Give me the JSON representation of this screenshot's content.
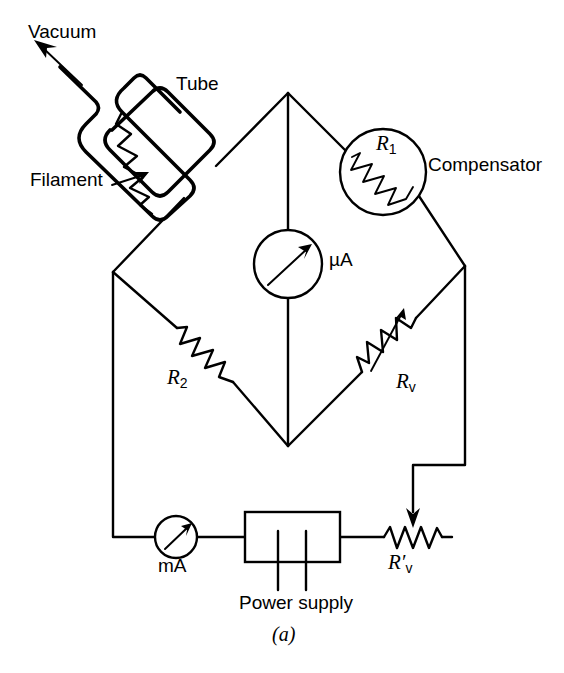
{
  "figure": {
    "caption": "(a)",
    "kind": "circuit-diagram",
    "ink_color": "#000000",
    "background_color": "#ffffff"
  },
  "labels": {
    "vacuum": "Vacuum",
    "tube": "Tube",
    "filament": "Filament",
    "compensator": "Compensator",
    "microammeter": "µA",
    "milliammeter": "mA",
    "power_supply": "Power supply"
  },
  "components": [
    {
      "id": "r1",
      "name": "R1",
      "symbol": "resistor-in-circle",
      "label_main": "R",
      "label_sub": "1",
      "annotation": "Compensator",
      "branch": "top-right"
    },
    {
      "id": "r2",
      "name": "R2",
      "symbol": "resistor",
      "label_main": "R",
      "label_sub": "2",
      "branch": "bottom-left"
    },
    {
      "id": "rv",
      "name": "Rv",
      "symbol": "variable-resistor",
      "label_main": "R",
      "label_sub": "v",
      "branch": "bottom-right"
    },
    {
      "id": "rv-prime",
      "name": "R'v",
      "symbol": "potentiometer",
      "label_main": "R",
      "label_prime": "′",
      "label_sub": "v",
      "branch": "supply-loop"
    },
    {
      "id": "microammeter",
      "name": "microammeter",
      "symbol": "meter-circle-with-needle",
      "label": "µA",
      "branch": "bridge-galvanometer"
    },
    {
      "id": "milliammeter",
      "name": "milliammeter",
      "symbol": "meter-circle-with-needle",
      "label": "mA",
      "branch": "supply-loop"
    },
    {
      "id": "power-supply",
      "name": "power supply",
      "symbol": "box-with-two-terminals",
      "label": "Power supply",
      "branch": "supply-loop"
    },
    {
      "id": "tube",
      "name": "tube",
      "symbol": "evacuated-glass-envelope-with-filament",
      "label": "Tube",
      "branch": "top-left"
    }
  ],
  "annotations": [
    {
      "id": "vacuum-arrow",
      "text": "Vacuum",
      "points_to": "tube-neck",
      "direction": "up-left"
    },
    {
      "id": "filament-arrow",
      "text": "Filament",
      "points_to": "filament-zigzag",
      "direction": "up-right"
    }
  ]
}
